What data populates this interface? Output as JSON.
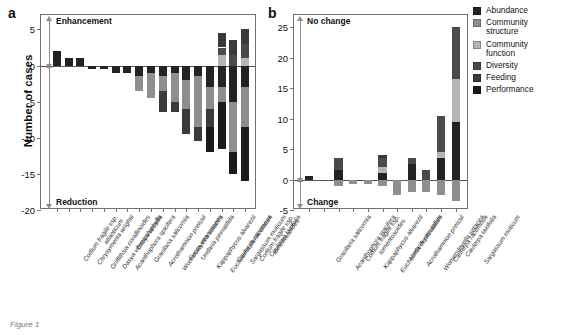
{
  "figure": {
    "caption": "Figure 1",
    "panel_a_letter": "a",
    "panel_b_letter": "b"
  },
  "legend": {
    "title": "",
    "position": "right",
    "items": [
      {
        "label": "Abundance",
        "color": "#232323"
      },
      {
        "label": "Community structure",
        "color": "#8e8e8e"
      },
      {
        "label": "Community function",
        "color": "#b5b5b5"
      },
      {
        "label": "Diversity",
        "color": "#4a4a4a"
      },
      {
        "label": "Feeding",
        "color": "#3a3a3a"
      },
      {
        "label": "Performance",
        "color": "#1b1b1b"
      }
    ]
  },
  "panel_a": {
    "letter": "a",
    "ylabel": "Number of cases",
    "top_annotation": "Enhancement",
    "bottom_annotation": "Reduction",
    "ytick_labels": [
      "5",
      "0",
      "-5",
      "-10",
      "-15",
      "-20"
    ]
  },
  "panel_b": {
    "letter": "b",
    "ylabel": "",
    "top_annotation": "No change",
    "bottom_annotation": "Change",
    "ytick_labels": [
      "25",
      "20",
      "15",
      "10",
      "5",
      "0",
      "-5"
    ]
  },
  "chart_data": [
    {
      "id": "panel_a",
      "type": "bar",
      "subtype": "stacked-diverging",
      "title": "a",
      "xlabel": "",
      "ylabel": "Number of cases",
      "ylim": [
        -20,
        7
      ],
      "yticks": [
        5,
        0,
        -5,
        -10,
        -15,
        -20
      ],
      "grid": false,
      "annotations": [
        {
          "text": "Enhancement",
          "position": "top-left",
          "direction": "up"
        },
        {
          "text": "Reduction",
          "position": "bottom-left",
          "direction": "down"
        }
      ],
      "categories": [
        "Codium fragile ssp. atlanticum",
        "Chrysymenia wrightii",
        "Griffithsia corallinoides",
        "Dasya vermiculophylla",
        "Acanthophora spicifera",
        "Dasya sessilis",
        "Gracilaria salicornia",
        "Acrothamnion preissii",
        "Womersleyella setacea",
        "Fucus evanescens",
        "Undaria pinnatifida",
        "Kappaphycus alvarezii",
        "Eucheuma denticulatum",
        "Caulerpa racemosa",
        "Sargassum muticum",
        "Codium fragile ssp. tomentosoides",
        "Caulerpa taxifolia"
      ],
      "series": [
        {
          "name": "Abundance",
          "color": "#232323",
          "values": [
            2,
            1,
            1,
            -0.5,
            -0.5,
            -1,
            -1,
            -1.5,
            -1,
            -1.5,
            -1,
            -2,
            -1.5,
            -3,
            -3,
            -5,
            -3
          ]
        },
        {
          "name": "Community structure",
          "color": "#8e8e8e",
          "values": [
            0,
            0,
            0,
            0,
            0,
            0,
            0,
            -2,
            -3.5,
            -2,
            -4,
            -4,
            -7,
            -3,
            -2,
            -7,
            -5.5
          ]
        },
        {
          "name": "Community function",
          "color": "#b5b5b5",
          "values": [
            0,
            0,
            0,
            0,
            0,
            0,
            0,
            0,
            0,
            0,
            0,
            0,
            0,
            0,
            1.5,
            0,
            1
          ]
        },
        {
          "name": "Diversity",
          "color": "#4a4a4a",
          "values": [
            0,
            0,
            0,
            0,
            0,
            0,
            0,
            0,
            0,
            0,
            0,
            0,
            0,
            0,
            1,
            1.5,
            2
          ]
        },
        {
          "name": "Feeding",
          "color": "#3a3a3a",
          "values": [
            0,
            0,
            0,
            0,
            0,
            0,
            0,
            0,
            0,
            -3,
            -1.5,
            -3.5,
            -2,
            -2.5,
            2,
            2,
            2
          ]
        },
        {
          "name": "Performance",
          "color": "#1b1b1b",
          "values": [
            0,
            0,
            0,
            0,
            0,
            0,
            0,
            0,
            0,
            0,
            0,
            0,
            0,
            -3.5,
            -6.5,
            -3,
            -7.5
          ]
        }
      ],
      "totals_positive": [
        2,
        1,
        1,
        0,
        0,
        0,
        0,
        0,
        0,
        0,
        0,
        0,
        0,
        0,
        4.5,
        3.5,
        5
      ],
      "totals_negative": [
        0,
        0,
        0,
        -0.5,
        -0.5,
        -1,
        -1,
        -3.5,
        -4.5,
        -6.5,
        -6.5,
        -9.5,
        -10.5,
        -12,
        -13,
        -15,
        -19
      ]
    },
    {
      "id": "panel_b",
      "type": "bar",
      "subtype": "stacked-diverging",
      "title": "b",
      "xlabel": "",
      "ylabel": "",
      "ylim": [
        -5,
        27
      ],
      "yticks": [
        25,
        20,
        15,
        10,
        5,
        0,
        -5
      ],
      "grid": false,
      "annotations": [
        {
          "text": "No change",
          "position": "top-left",
          "direction": "up"
        },
        {
          "text": "Change",
          "position": "bottom-left",
          "direction": "down"
        }
      ],
      "categories": [
        "Gracilaria salicornia",
        "Acanthophora spicifera",
        "Codium fragile ssp. tomentosoides",
        "Kappaphycus alvarezii",
        "Eucheuma denticulatum",
        "Undaria pinnatifida",
        "Acrothamnion preissii",
        "Womersleyella setacea",
        "Caulerpa racemosa",
        "Caulerpa taxifolia",
        "Sargassum muticum"
      ],
      "series": [
        {
          "name": "Abundance",
          "color": "#232323",
          "values": [
            0.5,
            0,
            1.5,
            0,
            0,
            1,
            0,
            2.5,
            0,
            3.5,
            9.5
          ]
        },
        {
          "name": "Community structure",
          "color": "#8e8e8e",
          "values": [
            0,
            0,
            -1,
            -0.7,
            -0.8,
            -1,
            -2.5,
            -2,
            -2,
            -2.5,
            -3.5
          ]
        },
        {
          "name": "Community function",
          "color": "#b5b5b5",
          "values": [
            0,
            0,
            0,
            0,
            0,
            1,
            0,
            0,
            0,
            1,
            7
          ]
        },
        {
          "name": "Diversity",
          "color": "#4a4a4a",
          "values": [
            0,
            0,
            2,
            0,
            0,
            1.5,
            0,
            1,
            1.5,
            6,
            8.5
          ]
        },
        {
          "name": "Feeding",
          "color": "#3a3a3a",
          "values": [
            0,
            0,
            0,
            0,
            0,
            0.5,
            0,
            0,
            0,
            0,
            0
          ]
        },
        {
          "name": "Performance",
          "color": "#1b1b1b",
          "values": [
            0,
            0,
            0,
            0,
            0,
            0,
            0,
            0,
            0,
            0,
            0
          ]
        }
      ],
      "totals_positive": [
        0.5,
        0,
        3.5,
        0,
        0,
        4,
        0,
        3.5,
        1.5,
        10.5,
        25
      ],
      "totals_negative": [
        0,
        0,
        -1,
        -0.7,
        -0.8,
        -1,
        -2.5,
        -2,
        -2,
        -2.5,
        -3.5
      ]
    }
  ]
}
